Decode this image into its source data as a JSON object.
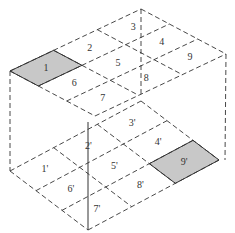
{
  "diagram": {
    "top_face": {
      "labels": [
        "1",
        "2",
        "3",
        "4",
        "5",
        "6",
        "7",
        "8",
        "9"
      ],
      "shaded": [
        "1"
      ]
    },
    "bottom_face": {
      "labels": [
        "1'",
        "2'",
        "3'",
        "4'",
        "5'",
        "6'",
        "7'",
        "8'",
        "9'"
      ],
      "shaded": [
        "9'"
      ]
    },
    "colors": {
      "line": "#333333",
      "shade": "#c8c8c8"
    }
  }
}
